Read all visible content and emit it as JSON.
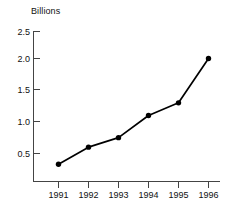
{
  "chart_data": {
    "type": "line",
    "title": "",
    "ylabel": "Billions",
    "xlabel": "",
    "categories": [
      "1991",
      "1992",
      "1993",
      "1994",
      "1995",
      "1996"
    ],
    "values": [
      0.33,
      0.6,
      0.75,
      1.1,
      1.3,
      2.0
    ],
    "series": [
      {
        "name": "Billions",
        "values": [
          0.33,
          0.6,
          0.75,
          1.1,
          1.3,
          2.0
        ]
      }
    ],
    "ylim": [
      0,
      2.5
    ],
    "yticks": [
      "0.5",
      "1.0",
      "1.5",
      "2.0",
      "2.5"
    ],
    "ytick_values": [
      0.5,
      1.0,
      1.5,
      2.0,
      2.5
    ],
    "xticks": [
      "1991",
      "1992",
      "1993",
      "1994",
      "1995",
      "1996"
    ],
    "grid": false,
    "legend": false,
    "marker": "filled-circle",
    "line_color": "#000000",
    "marker_color": "#000000",
    "axis_color": "#444444",
    "background_color": "#ffffff"
  }
}
